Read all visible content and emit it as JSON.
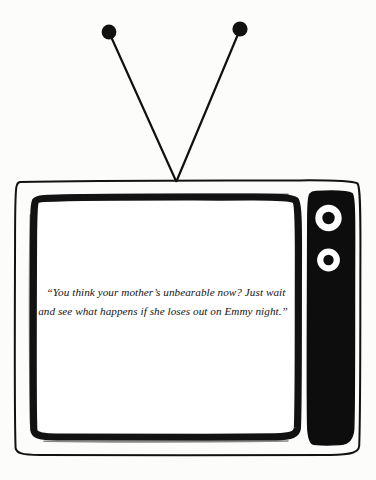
{
  "image": {
    "kind": "cartoon-line-art",
    "subject": "vintage television set with rabbit-ear antenna",
    "background_color": "#fcfcfb",
    "ink_color": "#111111",
    "width": 376,
    "height": 480
  },
  "caption": {
    "full_text": "“You think your mother’s unbearable now? Just wait and see what happens if she loses out on Emmy night.”",
    "line1": "“You think your mother’s unbearable now? Just wait",
    "line2": "and see what happens if she loses out on Emmy night.”",
    "style": "italic-serif",
    "color": "#141414"
  },
  "television": {
    "cabinet": {
      "label": "tv-cabinet",
      "x": 14,
      "y": 179,
      "width": 348,
      "height": 277,
      "stroke_color": "#111111"
    },
    "screen": {
      "label": "tv-screen",
      "x": 33,
      "y": 196,
      "width": 266,
      "height": 243,
      "fill_color": "#ffffff",
      "bezel_color": "#111111"
    },
    "control_panel": {
      "label": "control-panel",
      "x": 308,
      "y": 190,
      "width": 47,
      "height": 255,
      "fill_color": "#0d0d0d"
    },
    "dials": [
      {
        "name": "dial-upper",
        "cx": 328,
        "cy": 218,
        "outer_r": 13,
        "inner_r": 6,
        "ring_color": "#ffffff",
        "center_color": "#0d0d0d"
      },
      {
        "name": "dial-lower",
        "cx": 328,
        "cy": 260,
        "outer_r": 11,
        "inner_r": 5,
        "ring_color": "#ffffff",
        "center_color": "#0d0d0d"
      }
    ]
  },
  "antenna": {
    "junction": {
      "x": 176,
      "y": 181
    },
    "rods": [
      {
        "name": "antenna-rod-left",
        "tip_x": 109,
        "tip_y": 32,
        "knob_r": 7.5
      },
      {
        "name": "antenna-rod-right",
        "tip_x": 240,
        "tip_y": 29,
        "knob_r": 7.5
      }
    ],
    "stroke_color": "#111111",
    "stroke_width": 2.1
  }
}
